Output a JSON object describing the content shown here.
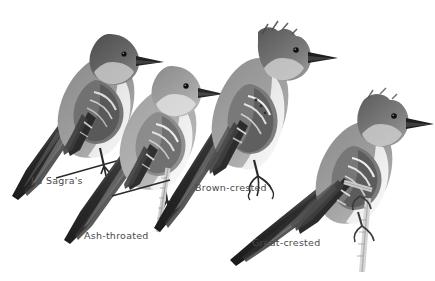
{
  "plate": {
    "background_color": "#ffffff",
    "width": 435,
    "height": 281,
    "style": "grayscale photographic bird identification plate",
    "label_color": "#4a4a4a"
  },
  "birds": [
    {
      "id": "la-sagras",
      "common_name": "La Sagra's",
      "label": "La Sagra's",
      "position": "upper-left",
      "facing": "right",
      "plumage": {
        "crown": "dark slate gray, smoothly rounded",
        "back": "medium gray",
        "throat_breast": "pale gray",
        "belly": "off-white",
        "wing": "blackish with whitish feather edging forming two pale wingbars",
        "tail": "long, dark, angled down toward lower-left",
        "bill": "straight, black",
        "eye": "small, black"
      },
      "perch": "thin dark twig under the feet"
    },
    {
      "id": "ash-throated",
      "common_name": "Ash-throated",
      "label": "Ash-throated",
      "position": "lower-center-left",
      "facing": "right",
      "plumage": {
        "crown": "pale brownish gray, lightly peaked",
        "back": "light gray",
        "throat_breast": "whitish gray",
        "belly": "pale cream",
        "wing": "dark gray with conspicuous white wing edging",
        "tail": "long, dark, angled down toward lower-left",
        "bill": "straight, black",
        "eye": "small, black"
      },
      "perch": "pale vertical twig gripped by the foot"
    },
    {
      "id": "brown-crested",
      "common_name": "Brown-crested",
      "label": "Brown-crested",
      "position": "upper-center-right",
      "facing": "right",
      "plumage": {
        "crown": "dark gray with a distinctly raised, shaggy crest",
        "back": "medium gray",
        "throat_breast": "pale gray",
        "belly": "whitish",
        "wing": "dark with bold white feather edges and rufous-toned primaries",
        "tail": "long, dark, angled down toward lower-left",
        "bill": "heavy, straight, black",
        "eye": "small, black"
      },
      "perch": "dark curved claw gripping an unseen perch"
    },
    {
      "id": "great-crested",
      "common_name": "Great-crested",
      "label": "Great-crested",
      "position": "lower-right",
      "facing": "right",
      "plumage": {
        "crown": "dark gray, slightly peaked",
        "back": "medium gray",
        "throat_breast": "gray",
        "belly": "pale yellowish white",
        "wing": "blackish with strong white wingbars and edging",
        "tail": "long, dark, angled down toward lower-left",
        "bill": "stout, straight, black",
        "eye": "small, black"
      },
      "perch": "pale vertical branch running down the right side"
    }
  ]
}
